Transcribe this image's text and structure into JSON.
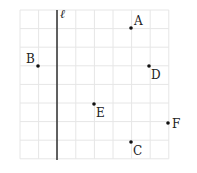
{
  "diagram": {
    "type": "grid-points-with-line",
    "grid": {
      "cols": 8,
      "rows": 8,
      "x0": 20,
      "y0": 10,
      "cell": 18.6,
      "color": "#e6e6e6"
    },
    "line": {
      "label": "ℓ",
      "x": 57,
      "y1": 10,
      "y2": 160,
      "color": "#222222"
    },
    "points": [
      {
        "label": "A",
        "x": 131,
        "y": 28,
        "lx": 134,
        "ly": 25
      },
      {
        "label": "B",
        "x": 38,
        "y": 66,
        "lx": 26,
        "ly": 63
      },
      {
        "label": "D",
        "x": 149,
        "y": 66,
        "lx": 151,
        "ly": 79
      },
      {
        "label": "E",
        "x": 94,
        "y": 104,
        "lx": 96,
        "ly": 117
      },
      {
        "label": "F",
        "x": 168,
        "y": 123,
        "lx": 172,
        "ly": 128
      },
      {
        "label": "C",
        "x": 131,
        "y": 142,
        "lx": 133,
        "ly": 155
      }
    ]
  }
}
